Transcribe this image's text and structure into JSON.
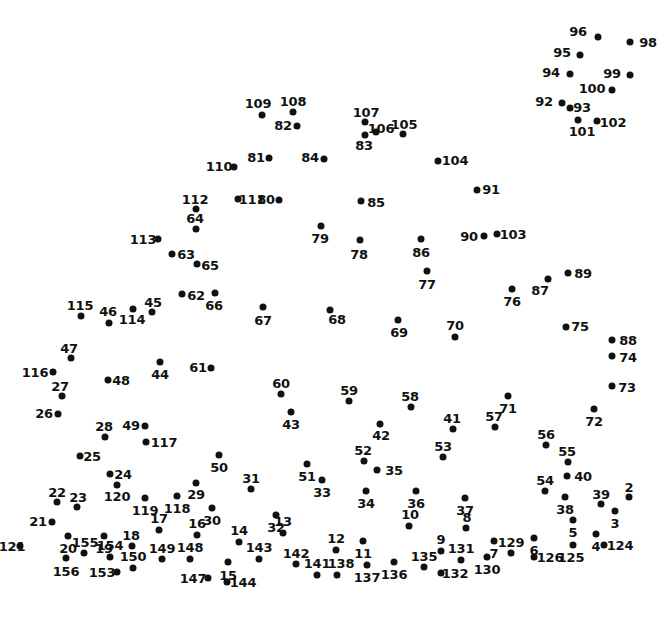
{
  "page": {
    "type": "connect-the-dots",
    "width": 672,
    "height": 618,
    "background_color": "#ffffff",
    "dot_color": "#111111",
    "label_color": "#111111",
    "total_dots": 156
  },
  "dots": [
    {
      "n": "96",
      "dx": 598,
      "dy": 37,
      "lx": 578,
      "ly": 31,
      "side": "left"
    },
    {
      "n": "98",
      "dx": 630,
      "dy": 42,
      "lx": 648,
      "ly": 42,
      "side": "right"
    },
    {
      "n": "95",
      "dx": 580,
      "dy": 55,
      "lx": 562,
      "ly": 52,
      "side": "left"
    },
    {
      "n": "94",
      "dx": 570,
      "dy": 74,
      "lx": 551,
      "ly": 72,
      "side": "left"
    },
    {
      "n": "99",
      "dx": 630,
      "dy": 75,
      "lx": 612,
      "ly": 73,
      "side": "left"
    },
    {
      "n": "100",
      "dx": 612,
      "dy": 90,
      "lx": 592,
      "ly": 88,
      "side": "left"
    },
    {
      "n": "92",
      "dx": 562,
      "dy": 103,
      "lx": 544,
      "ly": 101,
      "side": "left"
    },
    {
      "n": "93",
      "dx": 570,
      "dy": 108,
      "lx": 582,
      "ly": 107,
      "side": "right"
    },
    {
      "n": "101",
      "dx": 578,
      "dy": 120,
      "lx": 582,
      "ly": 131,
      "side": "below"
    },
    {
      "n": "102",
      "dx": 597,
      "dy": 121,
      "lx": 613,
      "ly": 122,
      "side": "right"
    },
    {
      "n": "109",
      "dx": 262,
      "dy": 115,
      "lx": 258,
      "ly": 103,
      "side": "above"
    },
    {
      "n": "108",
      "dx": 293,
      "dy": 112,
      "lx": 293,
      "ly": 101,
      "side": "above"
    },
    {
      "n": "82",
      "dx": 297,
      "dy": 126,
      "lx": 283,
      "ly": 125,
      "side": "left"
    },
    {
      "n": "107",
      "dx": 365,
      "dy": 122,
      "lx": 366,
      "ly": 112,
      "side": "above"
    },
    {
      "n": "106",
      "dx": 376,
      "dy": 132,
      "lx": 381,
      "ly": 128,
      "side": "right"
    },
    {
      "n": "83",
      "dx": 365,
      "dy": 135,
      "lx": 364,
      "ly": 145,
      "side": "below"
    },
    {
      "n": "105",
      "dx": 403,
      "dy": 134,
      "lx": 404,
      "ly": 124,
      "side": "above"
    },
    {
      "n": "110",
      "dx": 234,
      "dy": 167,
      "lx": 219,
      "ly": 166,
      "side": "left"
    },
    {
      "n": "81",
      "dx": 269,
      "dy": 158,
      "lx": 256,
      "ly": 157,
      "side": "left"
    },
    {
      "n": "84",
      "dx": 324,
      "dy": 159,
      "lx": 310,
      "ly": 157,
      "side": "left"
    },
    {
      "n": "104",
      "dx": 438,
      "dy": 161,
      "lx": 455,
      "ly": 160,
      "side": "right"
    },
    {
      "n": "91",
      "dx": 477,
      "dy": 190,
      "lx": 491,
      "ly": 189,
      "side": "right"
    },
    {
      "n": "112",
      "dx": 196,
      "dy": 209,
      "lx": 195,
      "ly": 199,
      "side": "above"
    },
    {
      "n": "111",
      "dx": 238,
      "dy": 199,
      "lx": 252,
      "ly": 199,
      "side": "right"
    },
    {
      "n": "80",
      "dx": 279,
      "dy": 200,
      "lx": 266,
      "ly": 199,
      "side": "left"
    },
    {
      "n": "85",
      "dx": 361,
      "dy": 201,
      "lx": 376,
      "ly": 202,
      "side": "right"
    },
    {
      "n": "64",
      "dx": 196,
      "dy": 229,
      "lx": 195,
      "ly": 218,
      "side": "above"
    },
    {
      "n": "79",
      "dx": 321,
      "dy": 226,
      "lx": 320,
      "ly": 238,
      "side": "below"
    },
    {
      "n": "113",
      "dx": 158,
      "dy": 239,
      "lx": 143,
      "ly": 239,
      "side": "left"
    },
    {
      "n": "90",
      "dx": 484,
      "dy": 236,
      "lx": 469,
      "ly": 236,
      "side": "left"
    },
    {
      "n": "103",
      "dx": 497,
      "dy": 234,
      "lx": 513,
      "ly": 234,
      "side": "right"
    },
    {
      "n": "78",
      "dx": 360,
      "dy": 240,
      "lx": 359,
      "ly": 254,
      "side": "below"
    },
    {
      "n": "86",
      "dx": 421,
      "dy": 239,
      "lx": 421,
      "ly": 252,
      "side": "below"
    },
    {
      "n": "63",
      "dx": 172,
      "dy": 254,
      "lx": 186,
      "ly": 254,
      "side": "right"
    },
    {
      "n": "65",
      "dx": 197,
      "dy": 264,
      "lx": 210,
      "ly": 265,
      "side": "right"
    },
    {
      "n": "77",
      "dx": 427,
      "dy": 271,
      "lx": 427,
      "ly": 284,
      "side": "below"
    },
    {
      "n": "89",
      "dx": 568,
      "dy": 273,
      "lx": 583,
      "ly": 273,
      "side": "right"
    },
    {
      "n": "87",
      "dx": 548,
      "dy": 279,
      "lx": 540,
      "ly": 290,
      "side": "below"
    },
    {
      "n": "76",
      "dx": 512,
      "dy": 289,
      "lx": 512,
      "ly": 301,
      "side": "below"
    },
    {
      "n": "62",
      "dx": 182,
      "dy": 294,
      "lx": 196,
      "ly": 295,
      "side": "right"
    },
    {
      "n": "66",
      "dx": 215,
      "dy": 293,
      "lx": 214,
      "ly": 305,
      "side": "below"
    },
    {
      "n": "115",
      "dx": 81,
      "dy": 316,
      "lx": 80,
      "ly": 305,
      "side": "above"
    },
    {
      "n": "45",
      "dx": 152,
      "dy": 312,
      "lx": 153,
      "ly": 302,
      "side": "above"
    },
    {
      "n": "114",
      "dx": 133,
      "dy": 309,
      "lx": 132,
      "ly": 319,
      "side": "below"
    },
    {
      "n": "46",
      "dx": 109,
      "dy": 323,
      "lx": 108,
      "ly": 311,
      "side": "above"
    },
    {
      "n": "67",
      "dx": 263,
      "dy": 307,
      "lx": 263,
      "ly": 320,
      "side": "below"
    },
    {
      "n": "68",
      "dx": 330,
      "dy": 310,
      "lx": 337,
      "ly": 319,
      "side": "below"
    },
    {
      "n": "69",
      "dx": 398,
      "dy": 320,
      "lx": 399,
      "ly": 332,
      "side": "below"
    },
    {
      "n": "70",
      "dx": 455,
      "dy": 337,
      "lx": 455,
      "ly": 325,
      "side": "above"
    },
    {
      "n": "75",
      "dx": 566,
      "dy": 327,
      "lx": 580,
      "ly": 326,
      "side": "right"
    },
    {
      "n": "88",
      "dx": 612,
      "dy": 340,
      "lx": 628,
      "ly": 340,
      "side": "right"
    },
    {
      "n": "47",
      "dx": 71,
      "dy": 358,
      "lx": 69,
      "ly": 348,
      "side": "above"
    },
    {
      "n": "74",
      "dx": 612,
      "dy": 356,
      "lx": 628,
      "ly": 357,
      "side": "right"
    },
    {
      "n": "116",
      "dx": 53,
      "dy": 372,
      "lx": 35,
      "ly": 372,
      "side": "left"
    },
    {
      "n": "44",
      "dx": 160,
      "dy": 362,
      "lx": 160,
      "ly": 374,
      "side": "below"
    },
    {
      "n": "61",
      "dx": 211,
      "dy": 368,
      "lx": 198,
      "ly": 367,
      "side": "left"
    },
    {
      "n": "48",
      "dx": 108,
      "dy": 380,
      "lx": 121,
      "ly": 380,
      "side": "right"
    },
    {
      "n": "73",
      "dx": 612,
      "dy": 386,
      "lx": 627,
      "ly": 387,
      "side": "right"
    },
    {
      "n": "60",
      "dx": 281,
      "dy": 394,
      "lx": 281,
      "ly": 383,
      "side": "above"
    },
    {
      "n": "59",
      "dx": 349,
      "dy": 401,
      "lx": 349,
      "ly": 390,
      "side": "above"
    },
    {
      "n": "58",
      "dx": 411,
      "dy": 407,
      "lx": 410,
      "ly": 396,
      "side": "above"
    },
    {
      "n": "71",
      "dx": 508,
      "dy": 396,
      "lx": 508,
      "ly": 408,
      "side": "below"
    },
    {
      "n": "27",
      "dx": 62,
      "dy": 396,
      "lx": 60,
      "ly": 386,
      "side": "above"
    },
    {
      "n": "43",
      "dx": 291,
      "dy": 412,
      "lx": 291,
      "ly": 424,
      "side": "below"
    },
    {
      "n": "42",
      "dx": 380,
      "dy": 424,
      "lx": 381,
      "ly": 435,
      "side": "below"
    },
    {
      "n": "26",
      "dx": 58,
      "dy": 414,
      "lx": 44,
      "ly": 413,
      "side": "left"
    },
    {
      "n": "57",
      "dx": 495,
      "dy": 427,
      "lx": 494,
      "ly": 416,
      "side": "above"
    },
    {
      "n": "72",
      "dx": 594,
      "dy": 409,
      "lx": 594,
      "ly": 421,
      "side": "below"
    },
    {
      "n": "41",
      "dx": 453,
      "dy": 429,
      "lx": 452,
      "ly": 418,
      "side": "above"
    },
    {
      "n": "49",
      "dx": 145,
      "dy": 426,
      "lx": 131,
      "ly": 425,
      "side": "left"
    },
    {
      "n": "117",
      "dx": 146,
      "dy": 442,
      "lx": 164,
      "ly": 442,
      "side": "right"
    },
    {
      "n": "28",
      "dx": 105,
      "dy": 437,
      "lx": 104,
      "ly": 426,
      "side": "above"
    },
    {
      "n": "56",
      "dx": 546,
      "dy": 445,
      "lx": 546,
      "ly": 434,
      "side": "above"
    },
    {
      "n": "53",
      "dx": 443,
      "dy": 457,
      "lx": 443,
      "ly": 446,
      "side": "above"
    },
    {
      "n": "55",
      "dx": 568,
      "dy": 462,
      "lx": 567,
      "ly": 451,
      "side": "above"
    },
    {
      "n": "25",
      "dx": 80,
      "dy": 456,
      "lx": 92,
      "ly": 456,
      "side": "right"
    },
    {
      "n": "50",
      "dx": 219,
      "dy": 455,
      "lx": 219,
      "ly": 467,
      "side": "below"
    },
    {
      "n": "52",
      "dx": 364,
      "dy": 461,
      "lx": 363,
      "ly": 450,
      "side": "above"
    },
    {
      "n": "35",
      "dx": 377,
      "dy": 470,
      "lx": 394,
      "ly": 470,
      "side": "right"
    },
    {
      "n": "40",
      "dx": 567,
      "dy": 476,
      "lx": 583,
      "ly": 476,
      "side": "right"
    },
    {
      "n": "51",
      "dx": 307,
      "dy": 464,
      "lx": 307,
      "ly": 476,
      "side": "below"
    },
    {
      "n": "33",
      "dx": 322,
      "dy": 480,
      "lx": 322,
      "ly": 492,
      "side": "below"
    },
    {
      "n": "54",
      "dx": 545,
      "dy": 491,
      "lx": 545,
      "ly": 480,
      "side": "above"
    },
    {
      "n": "29",
      "dx": 196,
      "dy": 483,
      "lx": 196,
      "ly": 494,
      "side": "below"
    },
    {
      "n": "31",
      "dx": 251,
      "dy": 489,
      "lx": 251,
      "ly": 478,
      "side": "above"
    },
    {
      "n": "22",
      "dx": 57,
      "dy": 502,
      "lx": 57,
      "ly": 492,
      "side": "above"
    },
    {
      "n": "23",
      "dx": 77,
      "dy": 507,
      "lx": 78,
      "ly": 497,
      "side": "above"
    },
    {
      "n": "34",
      "dx": 366,
      "dy": 491,
      "lx": 366,
      "ly": 503,
      "side": "below"
    },
    {
      "n": "36",
      "dx": 416,
      "dy": 491,
      "lx": 416,
      "ly": 503,
      "side": "below"
    },
    {
      "n": "39",
      "dx": 601,
      "dy": 504,
      "lx": 601,
      "ly": 494,
      "side": "above"
    },
    {
      "n": "2",
      "dx": 629,
      "dy": 497,
      "lx": 629,
      "ly": 487,
      "side": "above"
    },
    {
      "n": "119",
      "dx": 145,
      "dy": 498,
      "lx": 145,
      "ly": 510,
      "side": "below"
    },
    {
      "n": "118",
      "dx": 177,
      "dy": 496,
      "lx": 177,
      "ly": 508,
      "side": "below"
    },
    {
      "n": "120",
      "dx": 117,
      "dy": 485,
      "lx": 117,
      "ly": 496,
      "side": "below"
    },
    {
      "n": "24",
      "dx": 110,
      "dy": 474,
      "lx": 123,
      "ly": 474,
      "side": "right"
    },
    {
      "n": "30",
      "dx": 212,
      "dy": 508,
      "lx": 212,
      "ly": 520,
      "side": "below"
    },
    {
      "n": "37",
      "dx": 465,
      "dy": 498,
      "lx": 465,
      "ly": 510,
      "side": "below"
    },
    {
      "n": "38",
      "dx": 565,
      "dy": 497,
      "lx": 565,
      "ly": 509,
      "side": "below"
    },
    {
      "n": "3",
      "dx": 615,
      "dy": 511,
      "lx": 615,
      "ly": 523,
      "side": "below"
    },
    {
      "n": "21",
      "dx": 52,
      "dy": 522,
      "lx": 38,
      "ly": 521,
      "side": "left"
    },
    {
      "n": "8",
      "dx": 466,
      "dy": 528,
      "lx": 467,
      "ly": 517,
      "side": "above"
    },
    {
      "n": "5",
      "dx": 573,
      "dy": 520,
      "lx": 573,
      "ly": 532,
      "side": "below"
    },
    {
      "n": "10",
      "dx": 409,
      "dy": 526,
      "lx": 410,
      "ly": 514,
      "side": "above"
    },
    {
      "n": "17",
      "dx": 159,
      "dy": 530,
      "lx": 159,
      "ly": 518,
      "side": "above"
    },
    {
      "n": "16",
      "dx": 197,
      "dy": 535,
      "lx": 197,
      "ly": 523,
      "side": "above"
    },
    {
      "n": "32",
      "dx": 276,
      "dy": 515,
      "lx": 276,
      "ly": 527,
      "side": "below"
    },
    {
      "n": "13",
      "dx": 283,
      "dy": 533,
      "lx": 283,
      "ly": 521,
      "side": "above"
    },
    {
      "n": "14",
      "dx": 239,
      "dy": 542,
      "lx": 239,
      "ly": 530,
      "side": "above"
    },
    {
      "n": "18",
      "dx": 132,
      "dy": 546,
      "lx": 131,
      "ly": 535,
      "side": "above"
    },
    {
      "n": "19",
      "dx": 104,
      "dy": 536,
      "lx": 104,
      "ly": 548,
      "side": "below"
    },
    {
      "n": "20",
      "dx": 68,
      "dy": 536,
      "lx": 68,
      "ly": 548,
      "side": "below"
    },
    {
      "n": "12",
      "dx": 336,
      "dy": 550,
      "lx": 336,
      "ly": 538,
      "side": "above"
    },
    {
      "n": "11",
      "dx": 363,
      "dy": 541,
      "lx": 363,
      "ly": 553,
      "side": "below"
    },
    {
      "n": "9",
      "dx": 441,
      "dy": 551,
      "lx": 441,
      "ly": 539,
      "side": "above"
    },
    {
      "n": "7",
      "dx": 494,
      "dy": 541,
      "lx": 494,
      "ly": 553,
      "side": "below"
    },
    {
      "n": "129",
      "dx": 511,
      "dy": 553,
      "lx": 511,
      "ly": 542,
      "side": "above"
    },
    {
      "n": "6",
      "dx": 534,
      "dy": 538,
      "lx": 534,
      "ly": 550,
      "side": "below"
    },
    {
      "n": "4",
      "dx": 596,
      "dy": 534,
      "lx": 596,
      "ly": 546,
      "side": "below"
    },
    {
      "n": "124",
      "dx": 604,
      "dy": 545,
      "lx": 620,
      "ly": 545,
      "side": "right"
    },
    {
      "n": "125",
      "dx": 573,
      "dy": 545,
      "lx": 571,
      "ly": 557,
      "side": "below"
    },
    {
      "n": "131",
      "dx": 461,
      "dy": 560,
      "lx": 461,
      "ly": 548,
      "side": "above"
    },
    {
      "n": "121",
      "dx": 20,
      "dy": 546,
      "lx": 12,
      "ly": 546,
      "side": "left"
    },
    {
      "n": "155",
      "dx": 84,
      "dy": 553,
      "lx": 85,
      "ly": 542,
      "side": "above"
    },
    {
      "n": "154",
      "dx": 110,
      "dy": 557,
      "lx": 110,
      "ly": 545,
      "side": "above"
    },
    {
      "n": "149",
      "dx": 162,
      "dy": 559,
      "lx": 162,
      "ly": 548,
      "side": "above"
    },
    {
      "n": "148",
      "dx": 190,
      "dy": 559,
      "lx": 190,
      "ly": 547,
      "side": "above"
    },
    {
      "n": "150",
      "dx": 133,
      "dy": 568,
      "lx": 133,
      "ly": 556,
      "side": "above"
    },
    {
      "n": "156",
      "dx": 66,
      "dy": 558,
      "lx": 66,
      "ly": 571,
      "side": "below"
    },
    {
      "n": "153",
      "dx": 117,
      "dy": 572,
      "lx": 102,
      "ly": 572,
      "side": "left"
    },
    {
      "n": "143",
      "dx": 259,
      "dy": 559,
      "lx": 259,
      "ly": 547,
      "side": "above"
    },
    {
      "n": "15",
      "dx": 228,
      "dy": 562,
      "lx": 228,
      "ly": 575,
      "side": "below"
    },
    {
      "n": "142",
      "dx": 296,
      "dy": 564,
      "lx": 296,
      "ly": 553,
      "side": "above"
    },
    {
      "n": "141",
      "dx": 317,
      "dy": 575,
      "lx": 317,
      "ly": 563,
      "side": "above"
    },
    {
      "n": "138",
      "dx": 337,
      "dy": 575,
      "lx": 341,
      "ly": 563,
      "side": "above"
    },
    {
      "n": "137",
      "dx": 367,
      "dy": 565,
      "lx": 367,
      "ly": 577,
      "side": "below"
    },
    {
      "n": "136",
      "dx": 394,
      "dy": 562,
      "lx": 394,
      "ly": 574,
      "side": "below"
    },
    {
      "n": "135",
      "dx": 424,
      "dy": 567,
      "lx": 424,
      "ly": 556,
      "side": "above"
    },
    {
      "n": "132",
      "dx": 441,
      "dy": 573,
      "lx": 455,
      "ly": 573,
      "side": "right"
    },
    {
      "n": "130",
      "dx": 487,
      "dy": 557,
      "lx": 487,
      "ly": 569,
      "side": "below"
    },
    {
      "n": "126",
      "dx": 534,
      "dy": 557,
      "lx": 550,
      "ly": 557,
      "side": "right"
    },
    {
      "n": "147",
      "dx": 208,
      "dy": 578,
      "lx": 193,
      "ly": 578,
      "side": "left"
    },
    {
      "n": "144",
      "dx": 227,
      "dy": 582,
      "lx": 243,
      "ly": 582,
      "side": "right"
    }
  ]
}
